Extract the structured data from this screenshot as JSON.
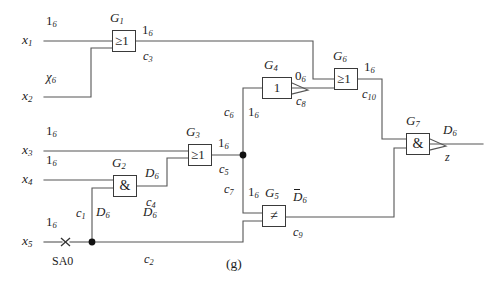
{
  "figure": {
    "caption": "(g)",
    "fault_marker": "SA0",
    "output_signal": "z",
    "line_color": "#555555",
    "box_color": "#3a3a3a",
    "node_color": "#111111"
  },
  "inputs": [
    {
      "name": "x",
      "sub": "1",
      "value": "1",
      "value_sub": "6"
    },
    {
      "name": "x",
      "sub": "2",
      "value": "χ",
      "value_sub": "6"
    },
    {
      "name": "x",
      "sub": "3",
      "value": "1",
      "value_sub": "6"
    },
    {
      "name": "x",
      "sub": "4",
      "value": "1",
      "value_sub": "6"
    },
    {
      "name": "x",
      "sub": "5",
      "value": "1",
      "value_sub": "6"
    }
  ],
  "gates": [
    {
      "id": "G",
      "sub": "1",
      "symbol": "≥1",
      "type": "or"
    },
    {
      "id": "G",
      "sub": "2",
      "symbol": "&",
      "type": "and"
    },
    {
      "id": "G",
      "sub": "3",
      "symbol": "≥1",
      "type": "or"
    },
    {
      "id": "G",
      "sub": "4",
      "symbol": "1",
      "type": "inverter"
    },
    {
      "id": "G",
      "sub": "5",
      "symbol": "≠",
      "type": "xor"
    },
    {
      "id": "G",
      "sub": "6",
      "symbol": "≥1",
      "type": "or"
    },
    {
      "id": "G",
      "sub": "7",
      "symbol": "&",
      "type": "nand"
    }
  ],
  "nets": [
    {
      "name": "c",
      "sub": "1",
      "value": "D",
      "value_sub": "6",
      "overline": false
    },
    {
      "name": "c",
      "sub": "2",
      "value": "D",
      "value_sub": "6",
      "overline": false
    },
    {
      "name": "c",
      "sub": "3",
      "value": "1",
      "value_sub": "6",
      "overline": false
    },
    {
      "name": "c",
      "sub": "4",
      "value": "D",
      "value_sub": "6",
      "overline": false
    },
    {
      "name": "c",
      "sub": "5",
      "value": "1",
      "value_sub": "6",
      "overline": false
    },
    {
      "name": "c",
      "sub": "6",
      "value": "1",
      "value_sub": "6",
      "overline": false
    },
    {
      "name": "c",
      "sub": "7",
      "value": "1",
      "value_sub": "6",
      "overline": false
    },
    {
      "name": "c",
      "sub": "8",
      "value": "0",
      "value_sub": "6",
      "overline": false
    },
    {
      "name": "c",
      "sub": "9",
      "value": "D",
      "value_sub": "6",
      "overline": true
    },
    {
      "name": "c",
      "sub": "10",
      "value": "1",
      "value_sub": "6",
      "overline": false
    }
  ],
  "output": {
    "name": "z",
    "value": "D",
    "value_sub": "6",
    "overline": false
  }
}
